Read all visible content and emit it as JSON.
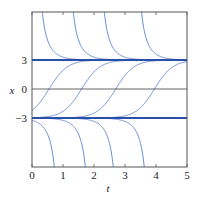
{
  "chart_data": {
    "type": "line",
    "title": "",
    "xlabel": "t",
    "ylabel": "x",
    "xlim": [
      0,
      5
    ],
    "ylim": [
      -8.5,
      8.5
    ],
    "xticks": [
      0,
      1,
      2,
      3,
      4,
      5
    ],
    "xtick_labels": [
      "0",
      "1",
      "2",
      "3",
      "4",
      "5"
    ],
    "yticks": [
      -3,
      0,
      3
    ],
    "ytick_labels": [
      "−3",
      "0",
      "3"
    ],
    "grid": false,
    "legend": null,
    "equilibria": [
      {
        "name": "x = 3",
        "value": 3,
        "color": "#2a4fa8"
      },
      {
        "name": "x = -3",
        "value": -3,
        "color": "#2a4fa8"
      },
      {
        "name": "x = 0 reference",
        "value": 0,
        "color": "#555555"
      }
    ],
    "rate": 1.7,
    "series": [
      {
        "name": "above x=3 curve 1",
        "kind": "above",
        "t0": 0.1
      },
      {
        "name": "above x=3 curve 2",
        "kind": "above",
        "t0": 1.1
      },
      {
        "name": "above x=3 curve 3",
        "kind": "above",
        "t0": 2.1
      },
      {
        "name": "above x=3 curve 4",
        "kind": "above",
        "t0": 3.3
      },
      {
        "name": "between curve 1",
        "kind": "middle",
        "t0": 0.55
      },
      {
        "name": "between curve 2",
        "kind": "middle",
        "t0": 1.6
      },
      {
        "name": "between curve 3",
        "kind": "middle",
        "t0": 2.7
      },
      {
        "name": "between curve 4",
        "kind": "middle",
        "t0": 3.95
      },
      {
        "name": "below x=-3 curve 1",
        "kind": "below",
        "t0": 0.95
      },
      {
        "name": "below x=-3 curve 2",
        "kind": "below",
        "t0": 1.95
      },
      {
        "name": "below x=-3 curve 3",
        "kind": "below",
        "t0": 2.85
      },
      {
        "name": "below x=-3 curve 4",
        "kind": "below",
        "t0": 3.85
      }
    ],
    "colors": {
      "curve": "#5a7fd0",
      "equilibrium": "#2a4fa8",
      "axis": "#555555"
    }
  }
}
